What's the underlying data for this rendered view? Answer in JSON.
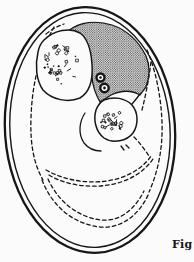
{
  "figure": {
    "caption": "Fig",
    "colors": {
      "ink": "#161616",
      "paper": "#fbfbfb"
    }
  }
}
